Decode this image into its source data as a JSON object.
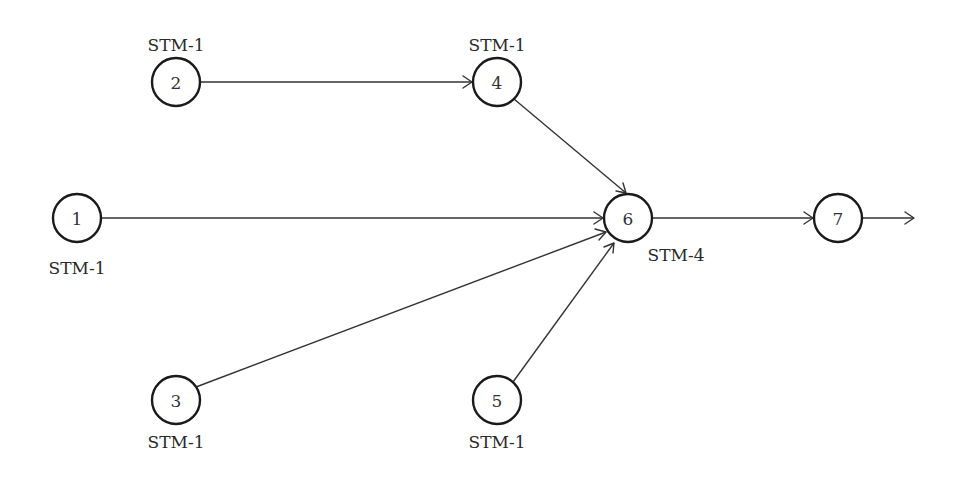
{
  "diagram": {
    "type": "directed-graph",
    "nodes": [
      {
        "id": "1",
        "label": "1",
        "rate": "STM-1",
        "cx": 77,
        "cy": 218,
        "rate_pos": "below"
      },
      {
        "id": "2",
        "label": "2",
        "rate": "STM-1",
        "cx": 176,
        "cy": 82,
        "rate_pos": "above"
      },
      {
        "id": "3",
        "label": "3",
        "rate": "STM-1",
        "cx": 176,
        "cy": 400,
        "rate_pos": "below"
      },
      {
        "id": "4",
        "label": "4",
        "rate": "STM-1",
        "cx": 497,
        "cy": 82,
        "rate_pos": "above"
      },
      {
        "id": "5",
        "label": "5",
        "rate": "STM-1",
        "cx": 497,
        "cy": 400,
        "rate_pos": "below"
      },
      {
        "id": "6",
        "label": "6",
        "rate": "STM-4",
        "cx": 628,
        "cy": 218,
        "rate_pos": "below-right"
      },
      {
        "id": "7",
        "label": "7",
        "rate": "",
        "cx": 838,
        "cy": 218,
        "rate_pos": "none"
      }
    ],
    "edges": [
      {
        "from": "2",
        "to": "4"
      },
      {
        "from": "4",
        "to": "6"
      },
      {
        "from": "1",
        "to": "6"
      },
      {
        "from": "3",
        "to": "6"
      },
      {
        "from": "5",
        "to": "6"
      },
      {
        "from": "6",
        "to": "7"
      },
      {
        "from": "7",
        "to": "output"
      }
    ],
    "node_radius": 24,
    "colors": {
      "stroke": "#1a1a1a",
      "edge": "#333333",
      "text": "#333333",
      "background": "#ffffff"
    }
  }
}
